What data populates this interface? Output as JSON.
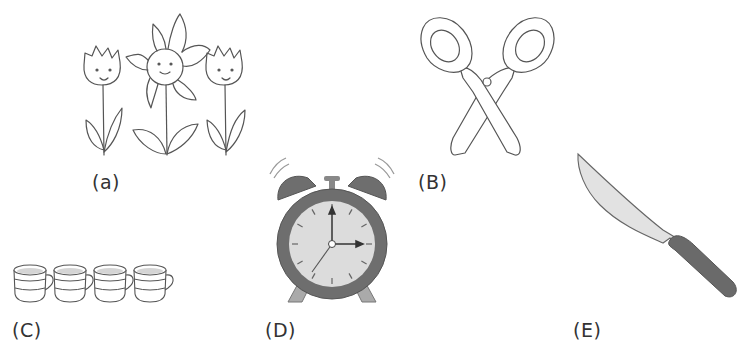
{
  "figure": {
    "items": [
      {
        "id": "a",
        "label": "(a)",
        "depicts": "three smiling flowers (two tulips and one daisy)"
      },
      {
        "id": "B",
        "label": "(B)",
        "depicts": "scissors"
      },
      {
        "id": "C",
        "label": "(C)",
        "depicts": "four cups in a row"
      },
      {
        "id": "D",
        "label": "(D)",
        "depicts": "ringing alarm clock showing 3 o'clock"
      },
      {
        "id": "E",
        "label": "(E)",
        "depicts": "kitchen knife"
      }
    ],
    "colors": {
      "line": "#555555",
      "dark_gray": "#6e6e6e",
      "light_gray": "#d9d9d9",
      "background": "#ffffff"
    }
  }
}
